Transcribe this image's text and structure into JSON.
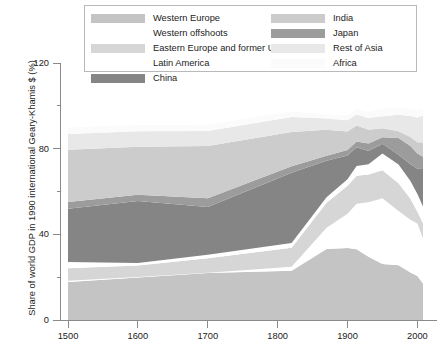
{
  "chart_data": {
    "type": "area",
    "stacked": true,
    "title": "",
    "xlabel": "",
    "ylabel": "Share of world GDP in 1990 international Geary-Khamis $ (%)",
    "xlim": [
      1500,
      2008
    ],
    "ylim": [
      0,
      120
    ],
    "xticks": [
      1500,
      1600,
      1700,
      1800,
      1900,
      2000
    ],
    "yticks": [
      0,
      40,
      80,
      120
    ],
    "grid": false,
    "legend_position": "top",
    "x": [
      1500,
      1600,
      1700,
      1820,
      1870,
      1900,
      1913,
      1930,
      1950,
      1973,
      1990,
      2000,
      2008
    ],
    "series": [
      {
        "name": "Western Europe",
        "color": "#c4c4c4",
        "values": [
          17.8,
          19.8,
          21.9,
          23.0,
          33.1,
          33.6,
          33.0,
          29.5,
          26.2,
          25.6,
          22.2,
          20.5,
          17.1
        ]
      },
      {
        "name": "Western offshoots",
        "color": "#ffffff",
        "values": [
          0.5,
          0.3,
          0.2,
          1.9,
          10.0,
          16.0,
          21.3,
          25.5,
          30.6,
          25.3,
          24.6,
          24.6,
          21.0
        ]
      },
      {
        "name": "Eastern Europe and former USSR",
        "color": "#d6d6d6",
        "values": [
          5.9,
          5.4,
          6.7,
          8.8,
          11.7,
          13.1,
          13.1,
          12.9,
          13.1,
          13.0,
          9.8,
          5.4,
          7.1
        ]
      },
      {
        "name": "Latin America",
        "color": "#ffffff",
        "values": [
          2.9,
          1.1,
          1.7,
          2.2,
          2.5,
          3.0,
          4.5,
          4.8,
          7.8,
          8.7,
          8.3,
          8.3,
          7.8
        ]
      },
      {
        "name": "China",
        "color": "#858585",
        "values": [
          24.9,
          29.0,
          22.3,
          32.9,
          17.1,
          11.1,
          8.8,
          6.2,
          4.6,
          4.6,
          7.8,
          11.8,
          17.5
        ]
      },
      {
        "name": "Japan",
        "color": "#9c9c9c",
        "values": [
          3.1,
          2.9,
          4.1,
          3.0,
          2.3,
          2.6,
          2.6,
          3.5,
          3.0,
          7.8,
          8.6,
          7.2,
          5.7
        ]
      },
      {
        "name": "India",
        "color": "#cccccc",
        "values": [
          24.4,
          22.4,
          24.4,
          16.0,
          12.1,
          8.6,
          7.5,
          6.4,
          4.2,
          3.1,
          4.1,
          5.2,
          6.7
        ]
      },
      {
        "name": "Rest of Asia",
        "color": "#e8e8e8",
        "values": [
          7.4,
          7.2,
          7.0,
          7.0,
          5.3,
          5.3,
          5.1,
          5.5,
          5.6,
          7.7,
          9.9,
          11.6,
          12.6
        ]
      },
      {
        "name": "Africa",
        "color": "#fbfbfb",
        "values": [
          3.0,
          3.0,
          2.9,
          2.5,
          2.0,
          2.3,
          2.5,
          2.8,
          3.6,
          3.4,
          3.3,
          3.2,
          3.3
        ]
      }
    ]
  },
  "legend": {
    "left_column": [
      {
        "label": "Western Europe",
        "color": "#c4c4c4"
      },
      {
        "label": "Western offshoots",
        "color": "#ffffff"
      },
      {
        "label": "Eastern Europe and former USSR",
        "color": "#d6d6d6"
      },
      {
        "label": "Latin America",
        "color": "#ffffff"
      },
      {
        "label": "China",
        "color": "#858585"
      }
    ],
    "right_column": [
      {
        "label": "India",
        "color": "#cccccc"
      },
      {
        "label": "Japan",
        "color": "#9c9c9c"
      },
      {
        "label": "Rest of Asia",
        "color": "#e8e8e8"
      },
      {
        "label": "Africa",
        "color": "#fbfbfb"
      }
    ]
  },
  "axes": {
    "y_title": "Share of world GDP in 1990 international Geary-Khamis $ (%)",
    "y_ticks": [
      "120",
      "80",
      "40",
      "0"
    ],
    "x_ticks": [
      "1500",
      "1600",
      "1700",
      "1800",
      "1900",
      "2000"
    ]
  },
  "style": {
    "axis_color": "#7d7d7d",
    "text_color": "#1c1c1c",
    "legend_border": "#b9b9b9",
    "background": "#ffffff"
  }
}
